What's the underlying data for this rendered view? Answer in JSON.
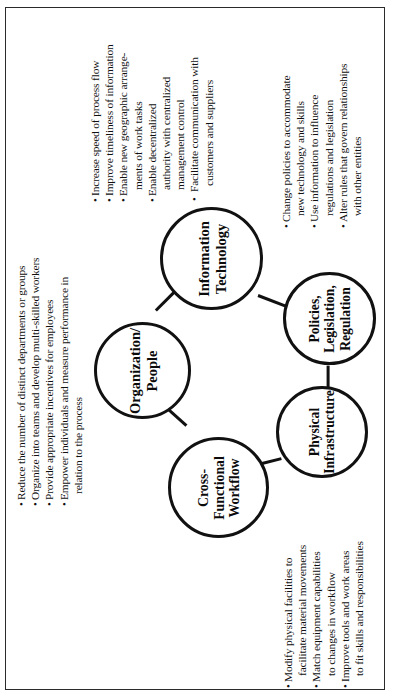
{
  "diagram": {
    "orientation": "rotated-90-ccw",
    "frame_color": "#2b2b2b",
    "node_color": "#111111",
    "nodes": [
      {
        "id": "organization-people",
        "line1": "Organization/",
        "line2": "People"
      },
      {
        "id": "information-technology",
        "line1": "Information",
        "line2": "Technology"
      },
      {
        "id": "cross-functional-workflow",
        "line1": "Cross-",
        "line2": "Functional",
        "line3": "Workflow"
      },
      {
        "id": "policies-legislation-regulation",
        "line1": "Policies,",
        "line2": "Legislation,",
        "line3": "Regulation"
      },
      {
        "id": "physical-infrastructure",
        "line1": "Physical",
        "line2": "Infrastructure"
      }
    ],
    "annotations": {
      "organization_people": {
        "for": "Organization/People",
        "lines": [
          {
            "bullet": true,
            "text": "Reduce the number of distinct departments or groups"
          },
          {
            "bullet": true,
            "text": "Organize into teams and develop multi-skilled workers"
          },
          {
            "bullet": true,
            "text": "Provide appropriate incentives for employees"
          },
          {
            "bullet": true,
            "text": "Empower individuals and measure performance in"
          },
          {
            "bullet": false,
            "text": "relation to the process"
          }
        ]
      },
      "information_technology": {
        "for": "Information Technology",
        "lines": [
          {
            "bullet": true,
            "text": "Increase speed of process flow"
          },
          {
            "bullet": true,
            "text": "Improve timeliness of information"
          },
          {
            "bullet": true,
            "text": "Enable new geographic arrange-"
          },
          {
            "bullet": false,
            "text": "ments of work tasks"
          },
          {
            "bullet": true,
            "text": "Enable decentralized"
          },
          {
            "bullet": false,
            "text": "authority  with centralized"
          },
          {
            "bullet": false,
            "text": "management control"
          },
          {
            "bullet": true,
            "text": "Facilitate communication with"
          },
          {
            "bullet": false,
            "text": "customers and suppliers"
          }
        ]
      },
      "policies_legislation_regulation": {
        "for": "Policies, Legislation, Regulation",
        "lines": [
          {
            "bullet": true,
            "text": "Change policies to accommodate"
          },
          {
            "bullet": false,
            "text": "new technology and skills"
          },
          {
            "bullet": true,
            "text": "Use information to influence"
          },
          {
            "bullet": false,
            "text": "regulations and legislation"
          },
          {
            "bullet": true,
            "text": "Alter rules that govern relationships"
          },
          {
            "bullet": false,
            "text": "with other entities"
          }
        ]
      },
      "physical_infrastructure": {
        "for": "Physical Infrastructure",
        "lines": [
          {
            "bullet": true,
            "text": "Modify physical facilities to"
          },
          {
            "bullet": false,
            "text": "facilitate material movements"
          },
          {
            "bullet": true,
            "text": "Match equipment capabilities"
          },
          {
            "bullet": false,
            "text": "to changes in workflow"
          },
          {
            "bullet": true,
            "text": "Improve tools and work areas"
          },
          {
            "bullet": false,
            "text": "to fit skills and responsibilities"
          }
        ]
      }
    }
  }
}
